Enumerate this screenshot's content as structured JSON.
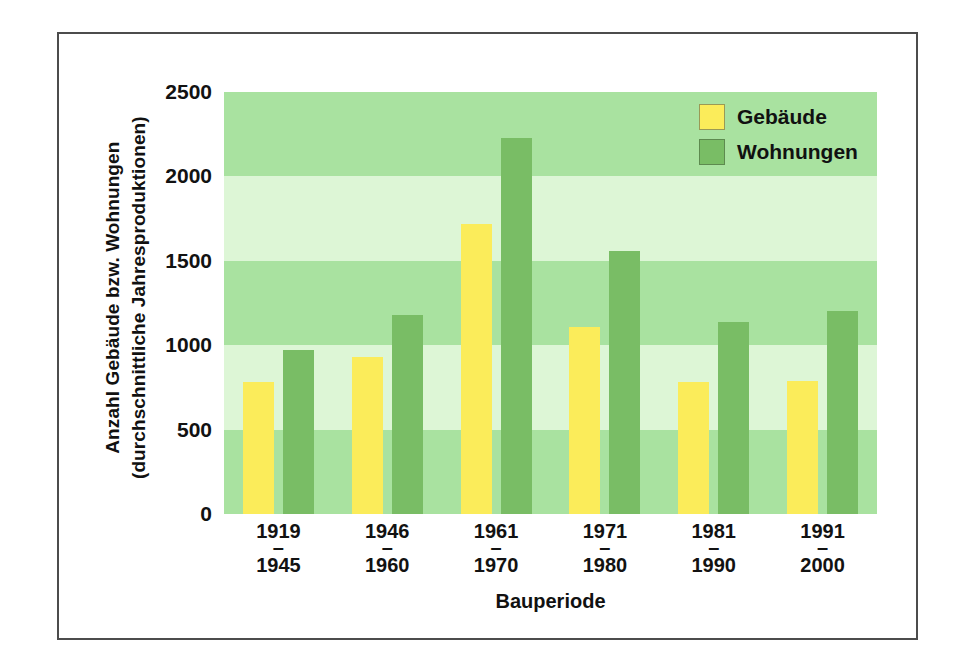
{
  "figure": {
    "y_axis_title_line1": "Anzahl Gebäude bzw. Wohnungen",
    "y_axis_title_line2": "(durchschnittliche Jahresproduktionen)",
    "x_axis_title": "Bauperiode",
    "legend": [
      {
        "key": "gebaeude",
        "label": "Gebäude",
        "color": "#fbec5a"
      },
      {
        "key": "wohnungen",
        "label": "Wohnungen",
        "color": "#79bd65"
      }
    ],
    "band_colors": {
      "dark": "#a9e2a0",
      "light": "#ddf6d6"
    },
    "frame_color": "#4c4c4c"
  },
  "chart_data": {
    "type": "bar",
    "title": "",
    "xlabel": "Bauperiode",
    "ylabel": "Anzahl Gebäude bzw. Wohnungen (durchschnittliche Jahresproduktionen)",
    "ylim": [
      0,
      2500
    ],
    "yticks": [
      0,
      500,
      1000,
      1500,
      2000,
      2500
    ],
    "ytick_labels": [
      "0",
      "500",
      "1000",
      "1500",
      "2000",
      "2500"
    ],
    "grid": "horizontal-bands",
    "legend_position": "top-right",
    "categories": [
      "1919–1945",
      "1946–1960",
      "1961–1970",
      "1971–1980",
      "1981–1990",
      "1991–2000"
    ],
    "category_parts": [
      {
        "start": "1919",
        "end": "1945"
      },
      {
        "start": "1946",
        "end": "1960"
      },
      {
        "start": "1961",
        "end": "1970"
      },
      {
        "start": "1971",
        "end": "1980"
      },
      {
        "start": "1981",
        "end": "1990"
      },
      {
        "start": "1991",
        "end": "2000"
      }
    ],
    "series": [
      {
        "name": "Gebäude",
        "color": "#fbec5a",
        "values": [
          780,
          930,
          1720,
          1110,
          780,
          790
        ]
      },
      {
        "name": "Wohnungen",
        "color": "#79bd65",
        "values": [
          970,
          1180,
          2230,
          1560,
          1140,
          1200
        ]
      }
    ]
  }
}
